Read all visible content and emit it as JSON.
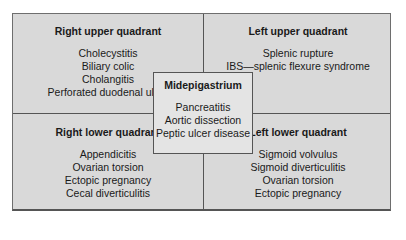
{
  "quadrants": {
    "right_upper": {
      "title": "Right upper quadrant",
      "items": [
        "Cholecystitis",
        "Biliary colic",
        "Cholangitis",
        "Perforated duodenal ulcer"
      ]
    },
    "left_upper": {
      "title": "Left upper quadrant",
      "items": [
        "Splenic rupture",
        "IBS—splenic flexure syndrome"
      ]
    },
    "right_lower": {
      "title": "Right lower quadrant",
      "items": [
        "Appendicitis",
        "Ovarian torsion",
        "Ectopic pregnancy",
        "Cecal diverticulitis"
      ]
    },
    "left_lower": {
      "title": "Left lower quadrant",
      "items": [
        "Sigmoid volvulus",
        "Sigmoid diverticulitis",
        "Ovarian torsion",
        "Ectopic pregnancy"
      ]
    }
  },
  "center": {
    "title": "Midepigastrium",
    "items": [
      "Pancreatitis",
      "Aortic dissection",
      "Peptic ulcer disease"
    ]
  },
  "colors": {
    "quadrant_fill": "#d9d9d9",
    "center_fill": "#e4e4e4",
    "border": "#555555"
  }
}
